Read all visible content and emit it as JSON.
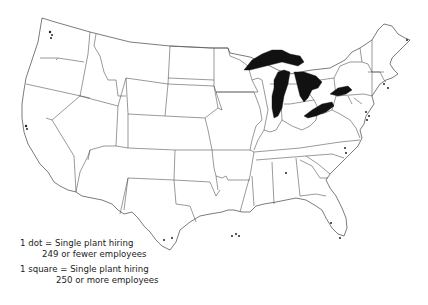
{
  "map": {
    "subject": "United States plant locations",
    "colors": {
      "lakes": "#111111",
      "borders": "#555555",
      "background": "#ffffff"
    }
  },
  "legend": {
    "dot_line1": "1 dot = Single plant hiring",
    "dot_line2": "249 or fewer employees",
    "square_line1": "1 square = Single plant hiring",
    "square_line2": "250 or more employees"
  }
}
